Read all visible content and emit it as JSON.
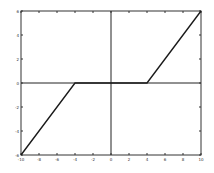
{
  "chart_data": {
    "type": "line",
    "title": "",
    "xlabel": "",
    "ylabel": "",
    "xlim": [
      -10,
      10
    ],
    "ylim": [
      -6,
      6
    ],
    "grid": false,
    "x_ticks": [
      -10,
      -8,
      -6,
      -4,
      -2,
      0,
      2,
      4,
      6,
      8,
      10
    ],
    "y_ticks": [
      -6,
      -4,
      -2,
      0,
      2,
      4,
      6
    ],
    "x_tick_labels": [
      "-10",
      "-8",
      "-6",
      "-4",
      "-2",
      "0",
      "2",
      "4",
      "6",
      "8",
      "10"
    ],
    "y_tick_labels": [
      "-6",
      "-4",
      "-2",
      "0",
      "2",
      "4",
      "6"
    ],
    "series": [
      {
        "name": "dead-zone",
        "x": [
          -10,
          -4,
          4,
          10
        ],
        "y": [
          -6,
          0,
          0,
          6
        ],
        "color": "#1a1a1a"
      }
    ],
    "reference_lines": [
      {
        "orientation": "horizontal",
        "value": 0
      },
      {
        "orientation": "vertical",
        "value": 0
      }
    ],
    "legend": null
  }
}
